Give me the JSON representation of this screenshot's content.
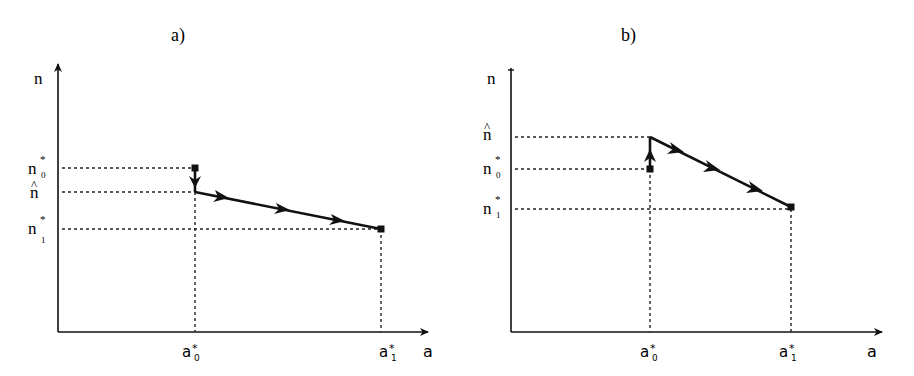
{
  "panels": [
    {
      "id": "a",
      "title": "a)",
      "y_axis_label": "n",
      "x_axis_label": "a",
      "y_ticks": [
        {
          "key": "n0",
          "base": "n",
          "sup": "*",
          "sub": "0"
        },
        {
          "key": "nhat",
          "base": "n",
          "hat": "^"
        },
        {
          "key": "n1",
          "base": "n",
          "sup": "*",
          "sub": "1"
        }
      ],
      "x_ticks": [
        {
          "key": "a0",
          "base": "a",
          "sup": "*",
          "sub": "0"
        },
        {
          "key": "a1",
          "base": "a",
          "sup": "*",
          "sub": "1"
        }
      ],
      "description": "Path starts at (a0*, n0*), drops down to n-hat, then moves along a declining line to (a1*, n1*)."
    },
    {
      "id": "b",
      "title": "b)",
      "y_axis_label": "n",
      "x_axis_label": "a",
      "y_ticks": [
        {
          "key": "nhat",
          "base": "n",
          "hat": "^"
        },
        {
          "key": "n0",
          "base": "n",
          "sup": "*",
          "sub": "0"
        },
        {
          "key": "n1",
          "base": "n",
          "sup": "*",
          "sub": "1"
        }
      ],
      "x_ticks": [
        {
          "key": "a0",
          "base": "a",
          "sup": "*",
          "sub": "0"
        },
        {
          "key": "a1",
          "base": "a",
          "sup": "*",
          "sub": "1"
        }
      ],
      "description": "Path starts at (a0*, n0*), jumps up to n-hat, then moves along a declining line to (a1*, n1*)."
    }
  ],
  "colors": {
    "line": "#111111",
    "dotted": "#222222",
    "background": "#ffffff"
  }
}
